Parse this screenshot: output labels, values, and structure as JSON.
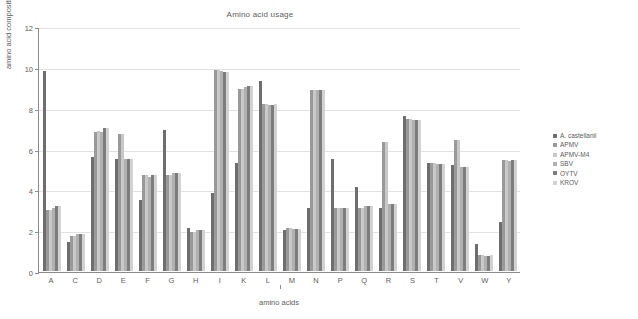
{
  "chart_data": {
    "type": "bar",
    "title": "Amino acid usage",
    "xlabel": "amino acids",
    "ylabel": "amino acid composition (%)",
    "ylim": [
      0,
      12
    ],
    "yticks": [
      0,
      2,
      4,
      6,
      8,
      10,
      12
    ],
    "grid": true,
    "legend_position": "right",
    "categories": [
      "A",
      "C",
      "D",
      "E",
      "F",
      "G",
      "H",
      "I",
      "K",
      "L",
      "M",
      "N",
      "P",
      "Q",
      "R",
      "S",
      "T",
      "V",
      "W",
      "Y"
    ],
    "series": [
      {
        "name": "A. castellanii",
        "color": "#6e6e6e",
        "values": [
          9.8,
          1.4,
          5.6,
          5.5,
          3.5,
          6.9,
          2.1,
          3.8,
          5.3,
          9.3,
          2.0,
          3.1,
          5.5,
          4.1,
          3.1,
          7.6,
          5.3,
          5.2,
          1.3,
          2.4
        ]
      },
      {
        "name": "APMV",
        "color": "#9a9a9a",
        "values": [
          3.0,
          1.7,
          6.8,
          6.7,
          4.7,
          4.7,
          1.9,
          9.85,
          8.9,
          8.2,
          2.1,
          8.85,
          3.1,
          3.1,
          6.3,
          7.45,
          5.3,
          6.4,
          0.8,
          5.45
        ]
      },
      {
        "name": "APMV-M4",
        "color": "#c8c8c8",
        "values": [
          3.0,
          1.7,
          6.85,
          6.7,
          4.7,
          4.7,
          1.9,
          9.85,
          8.9,
          8.2,
          2.1,
          8.85,
          3.1,
          3.1,
          6.3,
          7.45,
          5.3,
          6.4,
          0.8,
          5.45
        ]
      },
      {
        "name": "SBV",
        "color": "#b0b0b0",
        "values": [
          3.1,
          1.8,
          6.8,
          5.5,
          4.6,
          4.8,
          2.0,
          9.8,
          9.0,
          8.15,
          2.05,
          8.85,
          3.1,
          3.2,
          3.3,
          7.4,
          5.25,
          5.1,
          0.75,
          5.4
        ]
      },
      {
        "name": "OYTV",
        "color": "#7d7d7d",
        "values": [
          3.2,
          1.8,
          7.0,
          5.5,
          4.7,
          4.8,
          2.0,
          9.75,
          9.05,
          8.15,
          2.05,
          8.85,
          3.1,
          3.2,
          3.3,
          7.4,
          5.25,
          5.1,
          0.75,
          5.45
        ]
      },
      {
        "name": "KROV",
        "color": "#d2d2d2",
        "values": [
          3.2,
          1.8,
          7.0,
          5.5,
          4.7,
          4.8,
          2.0,
          9.75,
          9.05,
          8.2,
          2.05,
          8.85,
          3.1,
          3.2,
          3.3,
          7.4,
          5.25,
          5.1,
          0.8,
          5.45
        ]
      }
    ]
  }
}
